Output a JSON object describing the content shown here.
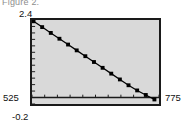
{
  "caption": "Figure 2.",
  "colors": {
    "plot_background": "#d9d9d9",
    "page_background": "#ffffff",
    "frame": "#1a1a1a",
    "line": "#000000",
    "marker": "#000000",
    "text": "#111111",
    "caption_text": "#8e8e8e"
  },
  "axis_labels": {
    "y_top": "2.4",
    "y_bottom": "-0.2",
    "x_left": "525",
    "x_right": "775"
  },
  "chart_data": {
    "type": "scatter",
    "title": "Figure 2.",
    "xlabel": "",
    "ylabel": "",
    "xlim": [
      525,
      775
    ],
    "ylim": [
      -0.2,
      2.4
    ],
    "grid": false,
    "legend": null,
    "zero_line": 0,
    "marker_style": "filled-square",
    "line_style": "solid",
    "x": [
      528,
      545,
      562,
      579,
      596,
      613,
      630,
      647,
      664,
      681,
      698,
      715,
      732,
      749,
      766
    ],
    "y": [
      2.36,
      2.18,
      2.0,
      1.82,
      1.64,
      1.46,
      1.28,
      1.1,
      0.92,
      0.74,
      0.56,
      0.38,
      0.22,
      0.08,
      -0.06
    ],
    "xticks": [
      525,
      550,
      575,
      600,
      625,
      650,
      675,
      700,
      725,
      750,
      775
    ],
    "yticks": [
      -0.2,
      0.0,
      0.2,
      0.4,
      0.6,
      0.8,
      1.0,
      1.2,
      1.4,
      1.6,
      1.8,
      2.0,
      2.2,
      2.4
    ]
  }
}
